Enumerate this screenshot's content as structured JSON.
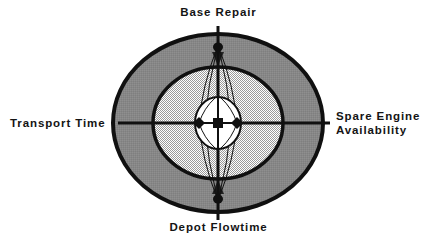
{
  "figure": {
    "type": "concentric-influence-diagram",
    "background_color": "#ffffff",
    "center": {
      "x": 218,
      "y": 123
    }
  },
  "labels": {
    "top": "Base Repair",
    "left": "Transport Time",
    "right_line1": "Spare Engine",
    "right_line2": "Availability",
    "bottom": "Depot Flowtime"
  },
  "colors": {
    "outline": "#101010",
    "outer_ring_fill": "#8a8a8a",
    "middle_ring_fill": "#d8d8d8",
    "inner_circle_fill": "#ffffff",
    "marker_fill": "#101010",
    "text": "#141414"
  },
  "rings": [
    {
      "name": "outer-ring",
      "fill_style": "solid-gray",
      "rx": 107,
      "ry": 90,
      "stroke_width": 4
    },
    {
      "name": "middle-ring",
      "fill_style": "crosshatch-light",
      "rx": 66,
      "ry": 57,
      "stroke_width": 3.5
    },
    {
      "name": "inner-circle",
      "fill_style": "white",
      "rx": 23,
      "ry": 26,
      "stroke_width": 2
    }
  ],
  "axes": [
    {
      "name": "axis-top",
      "direction": "up",
      "outer_end_y": 26
    },
    {
      "name": "axis-bottom",
      "direction": "down",
      "outer_end_y": 220
    },
    {
      "name": "axis-left",
      "direction": "left",
      "outer_end_x": 118
    },
    {
      "name": "axis-right",
      "direction": "right",
      "outer_end_x": 330
    }
  ],
  "markers": [
    {
      "name": "center-marker",
      "shape": "square",
      "x": 218,
      "y": 123
    },
    {
      "name": "left-node-marker",
      "shape": "diamond",
      "x": 199,
      "y": 123
    },
    {
      "name": "right-node-marker",
      "shape": "diamond",
      "x": 237,
      "y": 123
    },
    {
      "name": "top-node-marker",
      "shape": "blob",
      "x": 218,
      "y": 47
    },
    {
      "name": "bottom-node-marker",
      "shape": "blob",
      "x": 218,
      "y": 199
    }
  ],
  "spindle": {
    "name": "spindle-lens",
    "description": "Thin lines connecting left and right node markers to top and bottom node markers forming a spindle.",
    "line_width": 1
  }
}
